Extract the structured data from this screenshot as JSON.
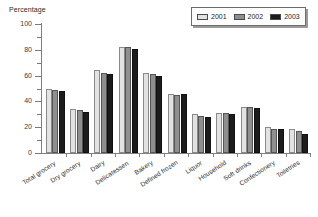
{
  "chart_data": {
    "type": "bar",
    "title": "",
    "ylabel": "Percentage",
    "xlabel": "",
    "ylim": [
      0,
      100
    ],
    "yticks": [
      0,
      20,
      40,
      60,
      80,
      100
    ],
    "yticks_minor": [
      10,
      30,
      50,
      70,
      90
    ],
    "grid": false,
    "legend_position": "top-right",
    "categories": [
      "Total grocery",
      "Dry grocery",
      "Dairy",
      "Delicatessen",
      "Bakery",
      "Defined frozen",
      "Liquor",
      "Household",
      "Soft drinks",
      "Confectionery",
      "Toiletries"
    ],
    "series": [
      {
        "name": "2001",
        "color": "#e2e2e2",
        "values": [
          50,
          34,
          64,
          82,
          62,
          46,
          30,
          31,
          36,
          20,
          19
        ]
      },
      {
        "name": "2002",
        "color": "#8f8f8f",
        "values": [
          49,
          33,
          62,
          82,
          61,
          45,
          29,
          31,
          36,
          19,
          17
        ]
      },
      {
        "name": "2003",
        "color": "#1c1c1c",
        "values": [
          48,
          32,
          61,
          81,
          60,
          46,
          28,
          30,
          35,
          19,
          15
        ]
      }
    ]
  }
}
